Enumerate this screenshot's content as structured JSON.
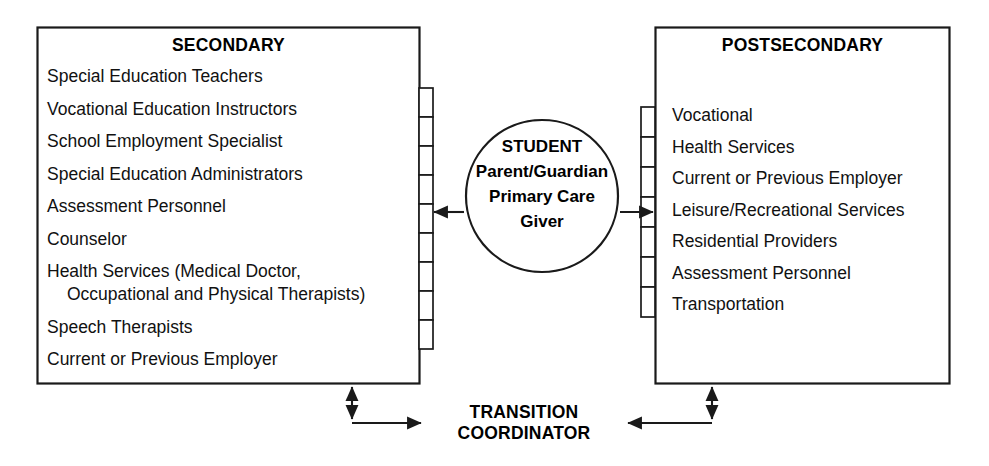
{
  "diagram": {
    "stroke_color": "#1a1a1a",
    "background_color": "#ffffff",
    "text_color": "#111111"
  },
  "secondary": {
    "title": "SECONDARY",
    "items": [
      "Special Education Teachers",
      "Vocational Education Instructors",
      "School Employment Specialist",
      "Special Education Administrators",
      "Assessment Personnel",
      "Counselor",
      "Health Services (Medical Doctor,",
      "Occupational and Physical Therapists)",
      "Speech Therapists",
      "Current or Previous Employer"
    ],
    "connector_cells": 9
  },
  "postsecondary": {
    "title": "POSTSECONDARY",
    "items": [
      "Vocational",
      "Health Services",
      "Current or Previous Employer",
      "Leisure/Recreational Services",
      "Residential Providers",
      "Assessment Personnel",
      "Transportation"
    ],
    "connector_cells": 7
  },
  "center": {
    "lines": [
      "STUDENT",
      "Parent/Guardian",
      "Primary Care",
      "Giver"
    ]
  },
  "coordinator": {
    "lines": [
      "TRANSITION",
      "COORDINATOR"
    ]
  }
}
